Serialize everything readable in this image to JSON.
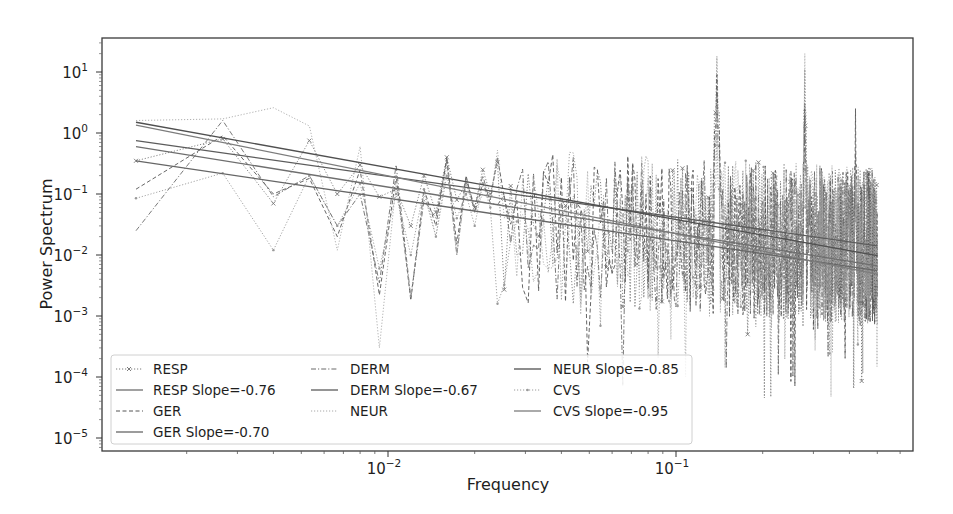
{
  "chart_data": {
    "type": "line",
    "title": "",
    "xlabel": "Frequency",
    "ylabel": "Power Spectrum",
    "xscale": "log",
    "yscale": "log",
    "xlim": [
      0.00077,
      0.95
    ],
    "ylim": [
      5e-06,
      40
    ],
    "grid": false,
    "legend_position": "lower left",
    "legend_columns": 3,
    "x_ticks": [
      {
        "value": 0.01,
        "base": "10",
        "exp": "−2"
      },
      {
        "value": 0.1,
        "base": "10",
        "exp": "−1"
      }
    ],
    "y_ticks": [
      {
        "value": 10,
        "base": "10",
        "exp": "1"
      },
      {
        "value": 1,
        "base": "10",
        "exp": "0"
      },
      {
        "value": 0.1,
        "base": "10",
        "exp": "−1"
      },
      {
        "value": 0.01,
        "base": "10",
        "exp": "−2"
      },
      {
        "value": 0.001,
        "base": "10",
        "exp": "−3"
      },
      {
        "value": 0.0001,
        "base": "10",
        "exp": "−4"
      },
      {
        "value": 1e-05,
        "base": "10",
        "exp": "−5"
      }
    ],
    "frequency_step": 0.0013333,
    "frequency_range": [
      0.0013333,
      0.5
    ],
    "series": [
      {
        "name": "RESP",
        "style": "dotted",
        "marker": "x",
        "color": "#7a7a7a",
        "low_freq_values": [
          0.35,
          0.8,
          0.07,
          0.75,
          0.1,
          0.3,
          0.09,
          0.12,
          0.03,
          0.2,
          0.05,
          0.4,
          0.08,
          0.15,
          0.06,
          0.25,
          0.1
        ],
        "peaks": [
          {
            "f": 0.139,
            "value": 18
          },
          {
            "f": 0.28,
            "value": 11
          },
          {
            "f": 0.42,
            "value": 0.35
          }
        ],
        "seed": 11
      },
      {
        "name": "RESP Slope=-0.76",
        "style": "solid",
        "fit_of": "RESP",
        "slope": -0.76,
        "color": "#6e6e6e",
        "start_value": 0.6
      },
      {
        "name": "GER",
        "style": "dashed",
        "marker": "",
        "color": "#555555",
        "low_freq_values": [
          0.12,
          0.9,
          0.1,
          0.18,
          0.02,
          0.25,
          0.0022,
          0.2,
          0.0018,
          0.12,
          0.03,
          0.4,
          0.015,
          0.2,
          0.05,
          0.15,
          0.08
        ],
        "peaks": [
          {
            "f": 0.139,
            "value": 9
          },
          {
            "f": 0.28,
            "value": 3
          },
          {
            "f": 0.42,
            "value": 2.5
          }
        ],
        "seed": 23
      },
      {
        "name": "GER Slope=-0.70",
        "style": "solid",
        "fit_of": "GER",
        "slope": -0.7,
        "color": "#666666",
        "start_value": 0.35
      },
      {
        "name": "DERM",
        "style": "dashdot",
        "marker": "",
        "color": "#6a6a6a",
        "low_freq_values": [
          0.025,
          1.6,
          0.09,
          0.2,
          0.03,
          0.1,
          0.0035,
          0.3,
          0.002,
          0.08,
          0.04,
          0.35,
          0.01,
          0.18,
          0.06,
          0.2,
          0.07
        ],
        "peaks": [
          {
            "f": 0.139,
            "value": 5
          },
          {
            "f": 0.28,
            "value": 2
          },
          {
            "f": 0.42,
            "value": 0.5
          }
        ],
        "seed": 37
      },
      {
        "name": "DERM Slope=-0.67",
        "style": "solid",
        "fit_of": "DERM",
        "slope": -0.67,
        "color": "#5c5c5c",
        "start_value": 0.75
      },
      {
        "name": "NEUR",
        "style": "dotted",
        "marker": "",
        "color": "#a8a8a8",
        "low_freq_values": [
          1.6,
          1.7,
          2.6,
          1.3,
          0.012,
          0.6,
          0.0003,
          0.15,
          0.002,
          0.1,
          0.02,
          0.3,
          0.01,
          0.15,
          0.05,
          0.1,
          0.08
        ],
        "peaks": [
          {
            "f": 0.139,
            "value": 3
          },
          {
            "f": 0.28,
            "value": 20
          },
          {
            "f": 0.42,
            "value": 0.2
          }
        ],
        "seed": 41
      },
      {
        "name": "NEUR Slope=-0.85",
        "style": "solid",
        "fit_of": "NEUR",
        "slope": -0.85,
        "color": "#505050",
        "start_value": 1.5
      },
      {
        "name": "CVS",
        "style": "dotted",
        "marker": ".",
        "color": "#9a9a9a",
        "low_freq_values": [
          0.085,
          0.22,
          0.012,
          0.2,
          0.03,
          0.15,
          0.006,
          0.1,
          0.01,
          0.12,
          0.02,
          0.2,
          0.04,
          0.1,
          0.03,
          0.15,
          0.06
        ],
        "peaks": [
          {
            "f": 0.139,
            "value": 1
          },
          {
            "f": 0.28,
            "value": 0.5
          },
          {
            "f": 0.42,
            "value": 0.3
          }
        ],
        "seed": 53
      },
      {
        "name": "CVS Slope=-0.95",
        "style": "solid",
        "fit_of": "CVS",
        "slope": -0.95,
        "color": "#7c7c7c",
        "start_value": 1.35
      }
    ]
  },
  "axes": {
    "xlabel": "Frequency",
    "ylabel": "Power Spectrum"
  },
  "legend": {
    "items": [
      {
        "label": "RESP",
        "style": "dotted",
        "marker": "x"
      },
      {
        "label": "RESP Slope=-0.76",
        "style": "solid",
        "marker": ""
      },
      {
        "label": "GER",
        "style": "dashed",
        "marker": ""
      },
      {
        "label": "GER Slope=-0.70",
        "style": "solid",
        "marker": ""
      },
      {
        "label": "DERM",
        "style": "dashdot",
        "marker": ""
      },
      {
        "label": "DERM Slope=-0.67",
        "style": "solid",
        "marker": ""
      },
      {
        "label": "NEUR",
        "style": "dotted",
        "marker": ""
      },
      {
        "label": "NEUR Slope=-0.85",
        "style": "solid",
        "marker": ""
      },
      {
        "label": "CVS",
        "style": "dotted",
        "marker": "."
      },
      {
        "label": "CVS Slope=-0.95",
        "style": "solid",
        "marker": ""
      }
    ]
  }
}
